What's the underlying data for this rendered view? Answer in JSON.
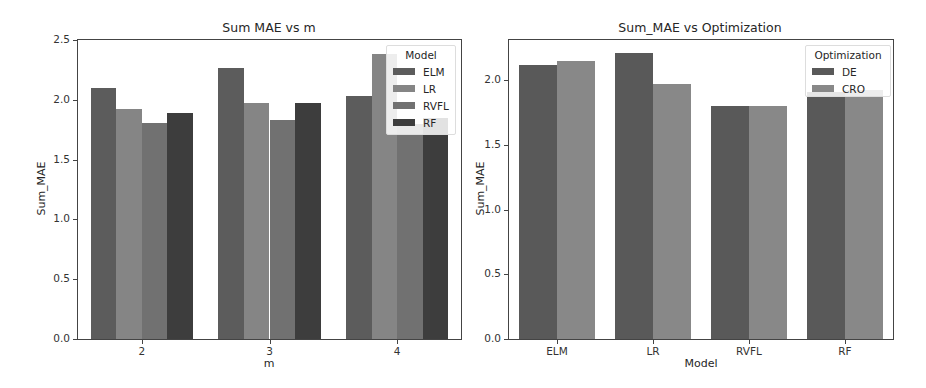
{
  "chart_data": [
    {
      "type": "bar",
      "title": "Sum MAE vs m",
      "xlabel": "m",
      "ylabel": "Sum_MAE",
      "categories": [
        "2",
        "3",
        "4"
      ],
      "series": [
        {
          "name": "ELM",
          "values": [
            2.1,
            2.27,
            2.03
          ],
          "color": "#5c5c5c"
        },
        {
          "name": "LR",
          "values": [
            1.92,
            1.97,
            2.38
          ],
          "color": "#858585"
        },
        {
          "name": "RVFL",
          "values": [
            1.81,
            1.83,
            1.8
          ],
          "color": "#717171"
        },
        {
          "name": "RF",
          "values": [
            1.89,
            1.97,
            1.85
          ],
          "color": "#3d3d3d"
        }
      ],
      "ylim": [
        0,
        2.5
      ],
      "yticks": [
        "0.0",
        "0.5",
        "1.0",
        "1.5",
        "2.0",
        "2.5"
      ],
      "grid": false,
      "legend": {
        "title": "Model",
        "position": "upper right",
        "entries": [
          "ELM",
          "LR",
          "RVFL",
          "RF"
        ]
      }
    },
    {
      "type": "bar",
      "title": "Sum_MAE vs Optimization",
      "xlabel": "Model",
      "ylabel": "Sum_MAE",
      "categories": [
        "ELM",
        "LR",
        "RVFL",
        "RF"
      ],
      "series": [
        {
          "name": "DE",
          "values": [
            2.12,
            2.21,
            1.8,
            1.91
          ],
          "color": "#595959"
        },
        {
          "name": "CRO",
          "values": [
            2.15,
            1.97,
            1.8,
            1.92
          ],
          "color": "#888888"
        }
      ],
      "ylim": [
        0,
        2.31
      ],
      "yticks": [
        "0.0",
        "0.5",
        "1.0",
        "1.5",
        "2.0"
      ],
      "grid": false,
      "legend": {
        "title": "Optimization",
        "position": "upper right",
        "entries": [
          "DE",
          "CRO"
        ]
      }
    }
  ]
}
